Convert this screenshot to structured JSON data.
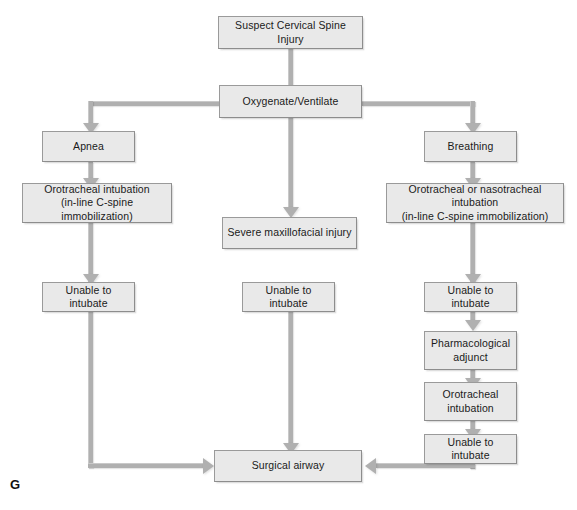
{
  "figure": {
    "label": "G",
    "nodes": {
      "suspect": "Suspect Cervical Spine Injury",
      "oxygenate": "Oxygenate/Ventilate",
      "apnea": "Apnea",
      "breathing": "Breathing",
      "oro_intub_line1": "Orotracheal intubation",
      "oro_intub_line2": "(in-line C-spine immobilization)",
      "oro_naso_line1": "Orotracheal or nasotracheal intubation",
      "oro_naso_line2": "(in-line C-spine immobilization)",
      "maxillofacial": "Severe maxillofacial injury",
      "unable_left": "Unable to intubate",
      "unable_center": "Unable to intubate",
      "unable_right_1": "Unable to intubate",
      "pharm_line1": "Pharmacological",
      "pharm_line2": "adjunct",
      "oro_intub_r_line1": "Orotracheal",
      "oro_intub_r_line2": "intubation",
      "unable_right_2": "Unable to intubate",
      "surgical": "Surgical airway"
    },
    "colors": {
      "node_fill": "#e9e9e9",
      "node_border": "#9a9a9a",
      "connector": "#b0b0b0",
      "text": "#1a1a1a",
      "background": "#ffffff"
    }
  }
}
